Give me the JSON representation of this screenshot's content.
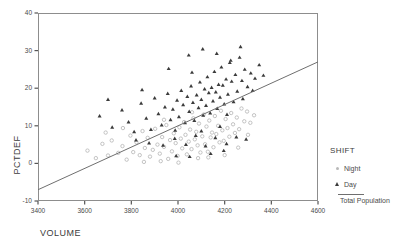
{
  "chart_data": {
    "type": "scatter",
    "title": "",
    "xlabel": "VOLUME",
    "ylabel": "PCTDEF",
    "xlim": [
      3400,
      4600
    ],
    "ylim": [
      -10,
      40
    ],
    "xticks": [
      3400,
      3600,
      3800,
      4000,
      4200,
      4400,
      4600
    ],
    "yticks": [
      -10,
      0,
      10,
      20,
      30,
      40
    ],
    "grid": false,
    "legend_position": "right",
    "legend_title": "SHIFT",
    "series": [
      {
        "name": "Night",
        "marker": "circle",
        "color": "#bcbcbc",
        "points": [
          [
            3612,
            3.4
          ],
          [
            3648,
            1.4
          ],
          [
            3676,
            5.2
          ],
          [
            3700,
            2.1
          ],
          [
            3716,
            6.1
          ],
          [
            3744,
            2.8
          ],
          [
            3762,
            4.6
          ],
          [
            3780,
            1.0
          ],
          [
            3796,
            7.4
          ],
          [
            3808,
            3.0
          ],
          [
            3822,
            5.6
          ],
          [
            3836,
            2.2
          ],
          [
            3848,
            8.6
          ],
          [
            3858,
            4.1
          ],
          [
            3870,
            6.8
          ],
          [
            3880,
            1.8
          ],
          [
            3892,
            3.6
          ],
          [
            3902,
            9.2
          ],
          [
            3912,
            5.0
          ],
          [
            3922,
            2.6
          ],
          [
            3932,
            7.0
          ],
          [
            3940,
            4.4
          ],
          [
            3950,
            10.2
          ],
          [
            3958,
            1.2
          ],
          [
            3966,
            6.2
          ],
          [
            3974,
            3.2
          ],
          [
            3982,
            8.0
          ],
          [
            3990,
            5.4
          ],
          [
            3998,
            2.0
          ],
          [
            4006,
            9.6
          ],
          [
            4012,
            6.6
          ],
          [
            4018,
            4.0
          ],
          [
            4026,
            11.0
          ],
          [
            4032,
            7.6
          ],
          [
            4038,
            2.4
          ],
          [
            4046,
            5.8
          ],
          [
            4052,
            9.0
          ],
          [
            4058,
            3.8
          ],
          [
            4066,
            12.0
          ],
          [
            4072,
            6.4
          ],
          [
            4078,
            8.4
          ],
          [
            4084,
            4.8
          ],
          [
            4090,
            10.6
          ],
          [
            4096,
            2.9
          ],
          [
            4104,
            7.2
          ],
          [
            4110,
            13.0
          ],
          [
            4116,
            5.1
          ],
          [
            4122,
            9.8
          ],
          [
            4128,
            3.1
          ],
          [
            4134,
            11.4
          ],
          [
            4140,
            6.9
          ],
          [
            4146,
            8.2
          ],
          [
            4152,
            4.3
          ],
          [
            4158,
            12.6
          ],
          [
            4164,
            7.8
          ],
          [
            4172,
            10.0
          ],
          [
            4178,
            5.6
          ],
          [
            4184,
            14.0
          ],
          [
            4190,
            8.8
          ],
          [
            4196,
            6.0
          ],
          [
            4204,
            11.8
          ],
          [
            4212,
            9.4
          ],
          [
            4220,
            7.1
          ],
          [
            4228,
            13.4
          ],
          [
            4236,
            10.4
          ],
          [
            4244,
            8.1
          ],
          [
            4252,
            12.2
          ],
          [
            4262,
            9.1
          ],
          [
            4272,
            14.6
          ],
          [
            4284,
            11.2
          ],
          [
            4296,
            13.8
          ],
          [
            4310,
            10.8
          ],
          [
            4326,
            12.8
          ],
          [
            3690,
            8.2
          ],
          [
            3764,
            9.4
          ],
          [
            3854,
            0.4
          ],
          [
            3926,
            0.6
          ],
          [
            4002,
            0.2
          ],
          [
            4060,
            13.6
          ],
          [
            4130,
            1.6
          ],
          [
            4200,
            2.2
          ],
          [
            4258,
            4.2
          ],
          [
            4300,
            7.6
          ],
          [
            3940,
            11.6
          ],
          [
            4086,
            1.4
          ]
        ]
      },
      {
        "name": "Day",
        "marker": "triangle",
        "color": "#3b3b3b",
        "points": [
          [
            3664,
            12.6
          ],
          [
            3718,
            9.6
          ],
          [
            3760,
            14.2
          ],
          [
            3788,
            11.0
          ],
          [
            3812,
            8.4
          ],
          [
            3842,
            16.0
          ],
          [
            3864,
            12.0
          ],
          [
            3884,
            9.0
          ],
          [
            3900,
            17.4
          ],
          [
            3916,
            13.2
          ],
          [
            3930,
            10.2
          ],
          [
            3944,
            15.0
          ],
          [
            3956,
            18.6
          ],
          [
            3968,
            11.6
          ],
          [
            3978,
            14.4
          ],
          [
            3988,
            8.8
          ],
          [
            3996,
            16.8
          ],
          [
            4004,
            12.4
          ],
          [
            4014,
            19.4
          ],
          [
            4022,
            15.6
          ],
          [
            4030,
            10.8
          ],
          [
            4040,
            17.8
          ],
          [
            4048,
            13.8
          ],
          [
            4056,
            20.6
          ],
          [
            4064,
            16.2
          ],
          [
            4070,
            11.4
          ],
          [
            4080,
            18.2
          ],
          [
            4088,
            14.8
          ],
          [
            4094,
            21.6
          ],
          [
            4100,
            17.0
          ],
          [
            4108,
            12.8
          ],
          [
            4114,
            19.8
          ],
          [
            4120,
            15.4
          ],
          [
            4126,
            23.0
          ],
          [
            4132,
            18.8
          ],
          [
            4138,
            13.4
          ],
          [
            4144,
            20.2
          ],
          [
            4150,
            16.6
          ],
          [
            4156,
            24.4
          ],
          [
            4162,
            19.0
          ],
          [
            4168,
            14.6
          ],
          [
            4174,
            21.0
          ],
          [
            4180,
            17.6
          ],
          [
            4186,
            25.6
          ],
          [
            4192,
            20.8
          ],
          [
            4198,
            15.8
          ],
          [
            4206,
            22.4
          ],
          [
            4214,
            18.4
          ],
          [
            4222,
            26.8
          ],
          [
            4230,
            21.8
          ],
          [
            4238,
            16.4
          ],
          [
            4246,
            23.6
          ],
          [
            4254,
            19.2
          ],
          [
            4264,
            28.2
          ],
          [
            4274,
            22.0
          ],
          [
            4286,
            25.0
          ],
          [
            4298,
            20.4
          ],
          [
            4312,
            24.0
          ],
          [
            4330,
            22.6
          ],
          [
            4348,
            26.2
          ],
          [
            4366,
            23.4
          ],
          [
            3820,
            6.2
          ],
          [
            3876,
            5.4
          ],
          [
            3936,
            4.8
          ],
          [
            3986,
            6.6
          ],
          [
            4034,
            5.0
          ],
          [
            4076,
            7.4
          ],
          [
            4118,
            4.6
          ],
          [
            4160,
            6.8
          ],
          [
            4208,
            5.2
          ],
          [
            4250,
            7.0
          ],
          [
            4292,
            6.4
          ],
          [
            3700,
            17.0
          ],
          [
            3846,
            19.6
          ],
          [
            3960,
            25.2
          ],
          [
            4046,
            28.8
          ],
          [
            4106,
            30.4
          ],
          [
            4166,
            29.2
          ],
          [
            4226,
            27.4
          ],
          [
            4268,
            31.0
          ],
          [
            4050,
            1.8
          ],
          [
            4140,
            2.6
          ],
          [
            4196,
            3.4
          ],
          [
            3992,
            2.0
          ],
          [
            4278,
            17.2
          ],
          [
            4320,
            19.4
          ],
          [
            4100,
            8.6
          ],
          [
            4180,
            9.8
          ],
          [
            4060,
            24.2
          ],
          [
            4210,
            13.0
          ]
        ]
      }
    ],
    "trendline": {
      "name": "Total Population",
      "x1": 3400,
      "y1": -7.0,
      "x2": 4600,
      "y2": 27.0,
      "color": "#6f6f6f"
    }
  },
  "legend": {
    "title": "SHIFT",
    "entries": [
      {
        "label": "Night"
      },
      {
        "label": "Day"
      }
    ],
    "line_label": "Total Population"
  },
  "axes": {
    "x_title": "VOLUME",
    "y_title": "PCTDEF"
  }
}
